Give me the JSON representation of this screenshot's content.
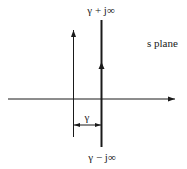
{
  "diagram": {
    "title": "s plane",
    "labels": {
      "top": "γ + j∞",
      "bottom": "γ − j∞",
      "offset": "γ",
      "plane": "s plane"
    },
    "colors": {
      "line": "#1a1a1a",
      "background": "#ffffff"
    }
  }
}
